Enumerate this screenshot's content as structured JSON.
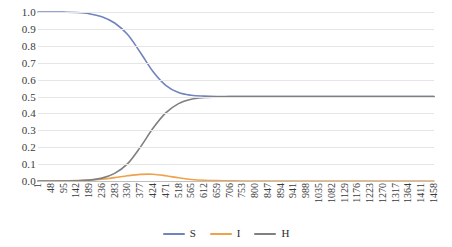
{
  "chart_data": {
    "type": "line",
    "title": "",
    "subtitle": "",
    "xlabel": "",
    "ylabel": "",
    "xlim": [
      1,
      1458
    ],
    "ylim": [
      0.0,
      1.0
    ],
    "grid": true,
    "legend_position": "bottom",
    "y_ticks": [
      "1.0",
      "0.9",
      "0.8",
      "0.7",
      "0.6",
      "0.5",
      "0.4",
      "0.3",
      "0.2",
      "0.1",
      "0.0"
    ],
    "x_ticks": [
      "1",
      "48",
      "95",
      "142",
      "189",
      "236",
      "283",
      "330",
      "377",
      "424",
      "471",
      "518",
      "565",
      "612",
      "659",
      "706",
      "753",
      "800",
      "847",
      "894",
      "941",
      "988",
      "1035",
      "1082",
      "1129",
      "1176",
      "1223",
      "1270",
      "1317",
      "1364",
      "1411",
      "1458"
    ],
    "x": [
      1,
      48,
      95,
      142,
      189,
      236,
      283,
      330,
      377,
      424,
      471,
      518,
      565,
      612,
      659,
      706,
      753,
      800,
      847,
      894,
      941,
      988,
      1035,
      1082,
      1129,
      1176,
      1223,
      1270,
      1317,
      1364,
      1411,
      1458
    ],
    "series": [
      {
        "name": "S",
        "color": "#7284be",
        "values": [
          1.0,
          1.0,
          0.999,
          0.997,
          0.99,
          0.972,
          0.935,
          0.868,
          0.762,
          0.648,
          0.566,
          0.523,
          0.507,
          0.502,
          0.5,
          0.5,
          0.5,
          0.5,
          0.5,
          0.5,
          0.5,
          0.5,
          0.5,
          0.5,
          0.5,
          0.5,
          0.5,
          0.5,
          0.5,
          0.5,
          0.5,
          0.5
        ]
      },
      {
        "name": "I",
        "color": "#eda24b",
        "values": [
          0.0,
          0.0,
          0.001,
          0.002,
          0.005,
          0.011,
          0.02,
          0.031,
          0.039,
          0.04,
          0.031,
          0.019,
          0.009,
          0.004,
          0.002,
          0.001,
          0.0,
          0.0,
          0.0,
          0.0,
          0.0,
          0.0,
          0.0,
          0.0,
          0.0,
          0.0,
          0.0,
          0.0,
          0.0,
          0.0,
          0.0,
          0.0
        ]
      },
      {
        "name": "H",
        "color": "#808080",
        "values": [
          0.0,
          0.0,
          0.0,
          0.001,
          0.005,
          0.017,
          0.045,
          0.101,
          0.199,
          0.312,
          0.403,
          0.458,
          0.484,
          0.494,
          0.498,
          0.499,
          0.5,
          0.5,
          0.5,
          0.5,
          0.5,
          0.5,
          0.5,
          0.5,
          0.5,
          0.5,
          0.5,
          0.5,
          0.5,
          0.5,
          0.5,
          0.5
        ]
      }
    ],
    "legend": [
      {
        "label": "S",
        "color": "#7284be"
      },
      {
        "label": "I",
        "color": "#eda24b"
      },
      {
        "label": "H",
        "color": "#808080"
      }
    ]
  }
}
